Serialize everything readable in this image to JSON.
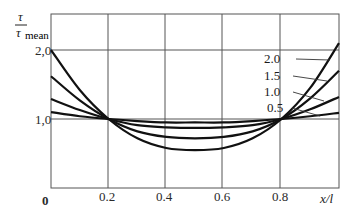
{
  "chart_data": {
    "type": "line",
    "title": "",
    "ylabel_numerator": "τ",
    "ylabel_denominator": "τ",
    "ylabel_subscript": "mean",
    "xlabel": "x/l",
    "xlim": [
      0,
      1.0
    ],
    "ylim": [
      0,
      2.0
    ],
    "x_ticks": [
      "0",
      "0.2",
      "0.4",
      "0.6",
      "0.8"
    ],
    "y_ticks": [
      "1,0",
      "2,0"
    ],
    "grid": true,
    "x": [
      0,
      0.1,
      0.2,
      0.3,
      0.4,
      0.5,
      0.6,
      0.7,
      0.8,
      0.9,
      1.0
    ],
    "series": [
      {
        "name": "2.0",
        "values": [
          2.0,
          1.42,
          1.0,
          0.72,
          0.58,
          0.55,
          0.58,
          0.72,
          1.0,
          1.45,
          2.1
        ]
      },
      {
        "name": "1.5",
        "values": [
          1.62,
          1.27,
          1.0,
          0.82,
          0.74,
          0.72,
          0.74,
          0.82,
          1.0,
          1.3,
          1.7
        ]
      },
      {
        "name": "1.0",
        "values": [
          1.29,
          1.13,
          1.0,
          0.91,
          0.88,
          0.87,
          0.88,
          0.91,
          1.0,
          1.14,
          1.32
        ]
      },
      {
        "name": "0.5",
        "values": [
          1.1,
          1.04,
          1.0,
          0.97,
          0.95,
          0.95,
          0.95,
          0.97,
          1.0,
          1.04,
          1.09
        ]
      }
    ],
    "legend_position": "inline-right"
  },
  "labels": {
    "y_num": "τ",
    "y_den": "τ",
    "y_sub": "mean",
    "x_axis": "x/l",
    "origin": "0",
    "xt1": "0.2",
    "xt2": "0.4",
    "xt3": "0.6",
    "xt4": "0.8",
    "yt1": "1,0",
    "yt2": "2,0",
    "s1": "2.0",
    "s2": "1.5",
    "s3": "1.0",
    "s4": "0.5"
  }
}
